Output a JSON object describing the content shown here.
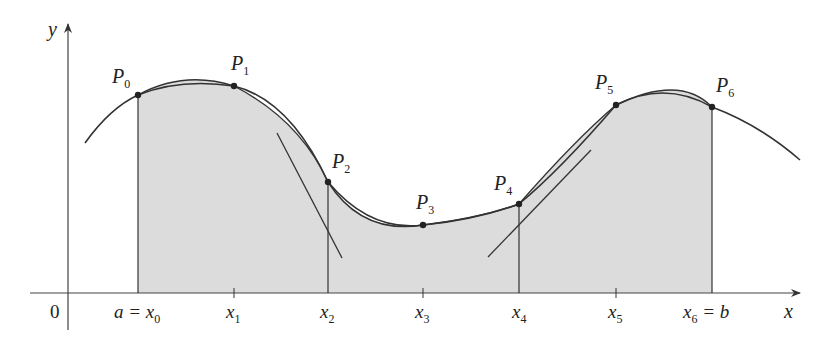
{
  "figure": {
    "type": "simpson-rule-parabolic-arcs",
    "axes": {
      "x_label": "x",
      "y_label": "y",
      "origin_label": "0"
    },
    "x_ticks": [
      {
        "id": "x0",
        "base": "a = x",
        "sub": "0",
        "suffix": ""
      },
      {
        "id": "x1",
        "base": "x",
        "sub": "1",
        "suffix": ""
      },
      {
        "id": "x2",
        "base": "x",
        "sub": "2",
        "suffix": ""
      },
      {
        "id": "x3",
        "base": "x",
        "sub": "3",
        "suffix": ""
      },
      {
        "id": "x4",
        "base": "x",
        "sub": "4",
        "suffix": ""
      },
      {
        "id": "x5",
        "base": "x",
        "sub": "5",
        "suffix": ""
      },
      {
        "id": "x6",
        "base": "x",
        "sub": "6",
        "suffix": " = b"
      }
    ],
    "points": [
      {
        "base": "P",
        "sub": "0"
      },
      {
        "base": "P",
        "sub": "1"
      },
      {
        "base": "P",
        "sub": "2"
      },
      {
        "base": "P",
        "sub": "3"
      },
      {
        "base": "P",
        "sub": "4"
      },
      {
        "base": "P",
        "sub": "5"
      },
      {
        "base": "P",
        "sub": "6"
      }
    ],
    "colors": {
      "curve": "#333333",
      "shade": "#dcdcdc",
      "axis": "#444444"
    }
  }
}
